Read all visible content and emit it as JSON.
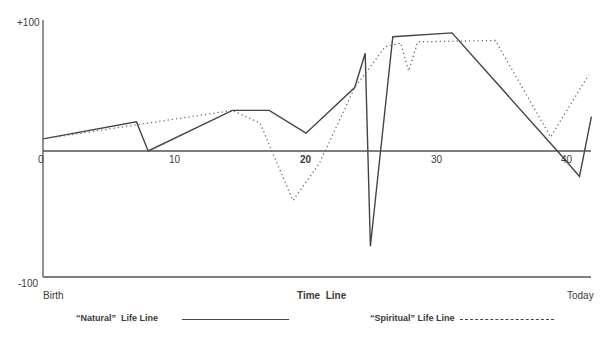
{
  "chart_data": {
    "type": "line",
    "title": "",
    "xlabel": "Time Line",
    "ylabel": "",
    "x_start_label": "Birth",
    "x_end_label": "Today",
    "y_top_label": "+100",
    "y_bottom_label": "-100",
    "xlim": [
      0,
      42
    ],
    "ylim": [
      -100,
      100
    ],
    "x_ticks": [
      0,
      10,
      20,
      30,
      40
    ],
    "x_tick_labels": [
      "0",
      "10",
      "20",
      "30",
      "40"
    ],
    "grid": false,
    "legend_position": "bottom",
    "series": [
      {
        "name": "“Natural” Life Line",
        "style": "solid",
        "x": [
          0,
          7.1,
          8,
          14.4,
          17.2,
          20,
          23.7,
          24.5,
          24.9,
          26.6,
          31.1,
          39.2,
          40.8,
          41.7
        ],
        "values": [
          9.5,
          23,
          0,
          32,
          32,
          14,
          50,
          77,
          -75,
          90,
          93,
          -1,
          -20,
          27
        ]
      },
      {
        "name": "“Spiritual” Life Line",
        "style": "dotted",
        "x": [
          0,
          14.4,
          16.5,
          19,
          21,
          23.7,
          24.8,
          26,
          27.2,
          27.8,
          28.5,
          34.4,
          38.6,
          41.5
        ],
        "values": [
          9.5,
          32,
          22,
          -39,
          -10,
          50,
          65,
          82,
          85,
          63,
          86,
          87,
          11,
          60
        ]
      }
    ]
  },
  "labels": {
    "y_top": "+100",
    "y_bottom": "-100",
    "x_zero": "0",
    "x_10": "10",
    "x_20": "20",
    "x_30": "30",
    "x_40": "40",
    "birth": "Birth",
    "time_line": "Time  Line",
    "today": "Today",
    "legend_natural": "“Natural”  Life Line",
    "legend_spiritual": "“Spiritual” Life Line"
  }
}
